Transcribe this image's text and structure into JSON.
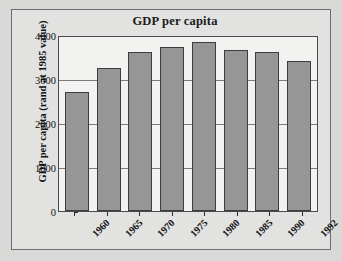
{
  "chart_data": {
    "type": "bar",
    "title": "GDP per capita",
    "xlabel": "",
    "ylabel": "GDP per capita (rand at 1985 value)",
    "categories": [
      "1960",
      "1965",
      "1970",
      "1975",
      "1980",
      "1985",
      "1990",
      "1992"
    ],
    "values": [
      2710,
      3260,
      3610,
      3730,
      3830,
      3660,
      3620,
      3420
    ],
    "ylim": [
      0,
      4000
    ],
    "yticks": [
      0,
      1000,
      2000,
      3000,
      4000
    ],
    "ytick_labels": [
      "0",
      "1000",
      "2000",
      "3000",
      "4000"
    ],
    "grid": true,
    "legend": false,
    "series": [
      {
        "name": "GDP per capita",
        "values": [
          2710,
          3260,
          3610,
          3730,
          3830,
          3660,
          3620,
          3420
        ]
      }
    ],
    "colors": {
      "bar_fill": "#969696",
      "bar_edge": "#3d3d3d",
      "plot_background": "#f2f2f0",
      "panel_background": "#e2e2e0",
      "page_background": "#d9d9d7",
      "gridline": "#7b7b7b",
      "text": "#111111"
    }
  }
}
